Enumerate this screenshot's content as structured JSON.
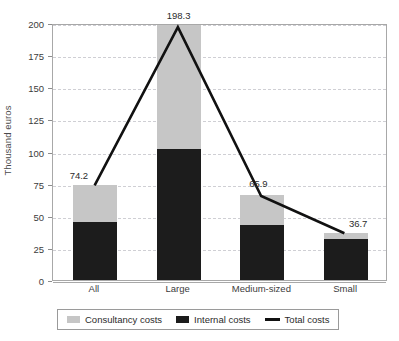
{
  "chart_data": {
    "type": "bar",
    "title": "",
    "subtitle": "",
    "xlabel": "",
    "ylabel": "Thousand euros",
    "ylim": [
      0,
      200
    ],
    "yticks": [
      0,
      25,
      50,
      75,
      100,
      125,
      150,
      175,
      200
    ],
    "ytick_labels": [
      "0",
      "25",
      "50",
      "75",
      "100",
      "125",
      "150",
      "175",
      "200"
    ],
    "grid": true,
    "grid_style": "dashed-horizontal",
    "legend_position": "bottom",
    "stacked": true,
    "categories": [
      "All",
      "Large",
      "Medium-sized",
      "Small"
    ],
    "series": [
      {
        "name": "Consultancy costs",
        "type": "bar",
        "color": "#c6c6c6",
        "values": [
          29.2,
          96.3,
          22.9,
          4.7
        ]
      },
      {
        "name": "Internal costs",
        "type": "bar",
        "color": "#1c1c1c",
        "values": [
          45.0,
          102.0,
          43.0,
          32.0
        ]
      },
      {
        "name": "Total costs",
        "type": "line",
        "color": "#111111",
        "values": [
          74.2,
          198.3,
          65.9,
          36.7
        ],
        "data_labels": [
          "74.2",
          "198.3",
          "65.9",
          "36.7"
        ]
      }
    ]
  },
  "axes": {
    "y_title": "Thousand euros"
  },
  "legend": {
    "items": [
      {
        "label": "Consultancy costs",
        "marker": "square-swatch-gray",
        "color": "#c6c6c6"
      },
      {
        "label": "Internal costs",
        "marker": "square-swatch-black",
        "color": "#1c1c1c"
      },
      {
        "label": "Total costs",
        "marker": "line-swatch-black",
        "color": "#111111"
      }
    ]
  }
}
